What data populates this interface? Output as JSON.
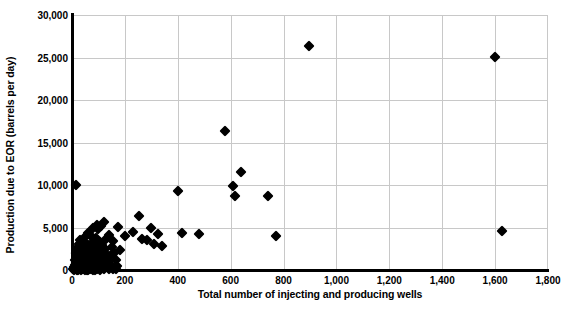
{
  "chart_data": {
    "type": "scatter",
    "title": "",
    "xlabel": "Total number of injecting and producing wells",
    "ylabel": "Production due to EOR (barrels per day)",
    "xlim": [
      0,
      1800
    ],
    "ylim": [
      0,
      30000
    ],
    "xticks": [
      0,
      200,
      400,
      600,
      800,
      1000,
      1200,
      1400,
      1600,
      1800
    ],
    "xtick_labels": [
      "0",
      "200",
      "400",
      "600",
      "800",
      "1,000",
      "1,200",
      "1,400",
      "1,600",
      "1,800"
    ],
    "yticks": [
      0,
      5000,
      10000,
      15000,
      20000,
      25000,
      30000
    ],
    "ytick_labels": [
      "0",
      "5,000",
      "10,000",
      "15,000",
      "20,000",
      "25,000",
      "30,000"
    ],
    "grid": true,
    "legend": null,
    "marker": "diamond",
    "marker_color": "#000000",
    "points": [
      [
        895,
        26400
      ],
      [
        1600,
        25100
      ],
      [
        580,
        16300
      ],
      [
        640,
        11500
      ],
      [
        610,
        9900
      ],
      [
        400,
        9250
      ],
      [
        15,
        9950
      ],
      [
        615,
        8700
      ],
      [
        740,
        8650
      ],
      [
        255,
        6300
      ],
      [
        120,
        5700
      ],
      [
        95,
        5300
      ],
      [
        110,
        5150
      ],
      [
        175,
        5050
      ],
      [
        80,
        4950
      ],
      [
        300,
        4900
      ],
      [
        100,
        4800
      ],
      [
        1625,
        4550
      ],
      [
        230,
        4500
      ],
      [
        415,
        4300
      ],
      [
        325,
        4250
      ],
      [
        480,
        4200
      ],
      [
        770,
        4000
      ],
      [
        60,
        4350
      ],
      [
        140,
        4100
      ],
      [
        200,
        4050
      ],
      [
        70,
        4000
      ],
      [
        50,
        3900
      ],
      [
        90,
        3800
      ],
      [
        130,
        3700
      ],
      [
        265,
        3650
      ],
      [
        30,
        3550
      ],
      [
        285,
        3500
      ],
      [
        155,
        3400
      ],
      [
        105,
        3300
      ],
      [
        45,
        3250
      ],
      [
        75,
        3150
      ],
      [
        310,
        3100
      ],
      [
        25,
        3050
      ],
      [
        115,
        2950
      ],
      [
        60,
        2900
      ],
      [
        340,
        2850
      ],
      [
        85,
        2800
      ],
      [
        150,
        2700
      ],
      [
        40,
        2650
      ],
      [
        20,
        2600
      ],
      [
        125,
        2500
      ],
      [
        95,
        2450
      ],
      [
        55,
        2400
      ],
      [
        180,
        2350
      ],
      [
        70,
        2250
      ],
      [
        35,
        2200
      ],
      [
        110,
        2150
      ],
      [
        160,
        2050
      ],
      [
        15,
        2000
      ],
      [
        80,
        1950
      ],
      [
        50,
        1900
      ],
      [
        130,
        1850
      ],
      [
        95,
        1800
      ],
      [
        25,
        1750
      ],
      [
        65,
        1700
      ],
      [
        145,
        1650
      ],
      [
        40,
        1600
      ],
      [
        105,
        1550
      ],
      [
        18,
        1500
      ],
      [
        75,
        1450
      ],
      [
        120,
        1400
      ],
      [
        55,
        1350
      ],
      [
        30,
        1300
      ],
      [
        90,
        1250
      ],
      [
        165,
        1200
      ],
      [
        12,
        1150
      ],
      [
        60,
        1100
      ],
      [
        45,
        1050
      ],
      [
        100,
        1000
      ],
      [
        135,
        980
      ],
      [
        22,
        950
      ],
      [
        70,
        900
      ],
      [
        38,
        870
      ],
      [
        85,
        840
      ],
      [
        115,
        800
      ],
      [
        15,
        780
      ],
      [
        52,
        750
      ],
      [
        95,
        720
      ],
      [
        28,
        690
      ],
      [
        65,
        660
      ],
      [
        145,
        640
      ],
      [
        10,
        610
      ],
      [
        42,
        580
      ],
      [
        78,
        560
      ],
      [
        105,
        530
      ],
      [
        20,
        500
      ],
      [
        58,
        480
      ],
      [
        88,
        450
      ],
      [
        32,
        430
      ],
      [
        125,
        400
      ],
      [
        8,
        380
      ],
      [
        48,
        350
      ],
      [
        72,
        330
      ],
      [
        98,
        300
      ],
      [
        16,
        280
      ],
      [
        38,
        260
      ],
      [
        62,
        240
      ],
      [
        112,
        220
      ],
      [
        85,
        200
      ],
      [
        25,
        180
      ],
      [
        50,
        160
      ],
      [
        140,
        150
      ],
      [
        5,
        140
      ],
      [
        30,
        120
      ],
      [
        68,
        110
      ],
      [
        95,
        100
      ],
      [
        12,
        90
      ],
      [
        42,
        80
      ],
      [
        75,
        70
      ],
      [
        120,
        60
      ],
      [
        18,
        55
      ],
      [
        55,
        45
      ],
      [
        88,
        40
      ],
      [
        35,
        30
      ],
      [
        8,
        25
      ],
      [
        62,
        20
      ],
      [
        105,
        15
      ],
      [
        22,
        12
      ],
      [
        48,
        10
      ],
      [
        80,
        8
      ],
      [
        155,
        120
      ],
      [
        168,
        90
      ],
      [
        150,
        300
      ],
      [
        172,
        450
      ]
    ]
  }
}
